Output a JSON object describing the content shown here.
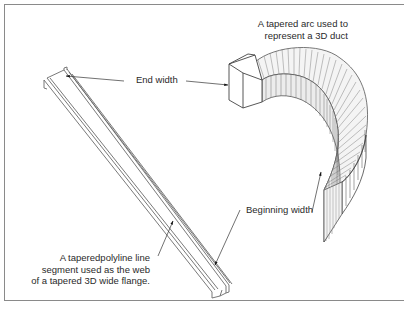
{
  "figure": {
    "annotations": {
      "duct_caption": [
        "A tapered arc used to",
        "represent a 3D duct"
      ],
      "end_width": "End width",
      "beginning_width": "Beginning width",
      "flange_caption": [
        "A taperedpolyline line",
        "segment used as the web",
        "of a tapered 3D wide flange."
      ]
    },
    "objects": [
      {
        "name": "tapered-3d-wide-flange",
        "description": "Long tapered I-beam drawn diagonally from upper-left to lower-right"
      },
      {
        "name": "tapered-arc-duct",
        "description": "Semicircular tapered 3D duct with vertical hatching"
      }
    ],
    "colors": {
      "line": "#555555",
      "frame": "#8a8a8a",
      "text": "#2a2a2a",
      "background": "#ffffff"
    }
  }
}
